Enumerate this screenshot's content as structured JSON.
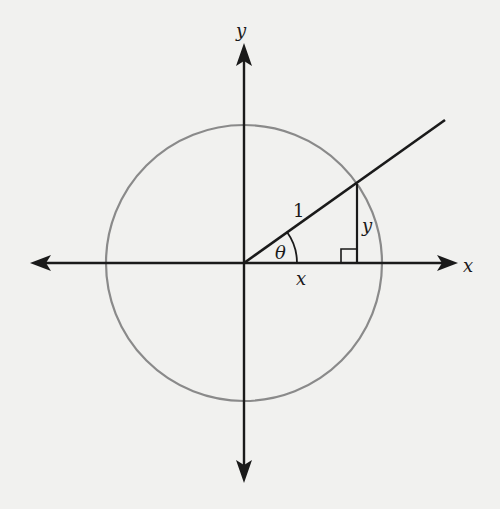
{
  "diagram": {
    "labels": {
      "y_axis": "y",
      "x_axis": "x",
      "hypotenuse": "1",
      "angle": "θ",
      "opposite_side": "y",
      "adjacent_side": "x"
    },
    "geometry": {
      "origin": [
        244,
        263
      ],
      "radius": 138,
      "ray_end": [
        445,
        120
      ],
      "point_on_circle": [
        357,
        184
      ]
    },
    "colors": {
      "background": "#f1f1ef",
      "axes": "#1a1a1a",
      "circle": "#8a8a8a"
    }
  }
}
